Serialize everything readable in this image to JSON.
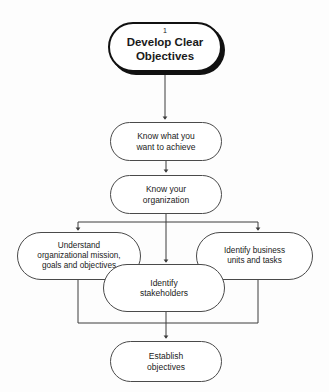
{
  "diagram": {
    "background_color": "#fdfdfd",
    "line_color": "#3d3d3d",
    "node_border_color": "#4a4a4a",
    "node_fill_color": "#ffffff",
    "text_color": "#1a1a1a",
    "nodes": {
      "start": {
        "step_number": "1",
        "label": "Develop Clear\nObjectives",
        "shape": "rounded-terminator",
        "emphasis": "bold-with-shadow"
      },
      "step2": {
        "label": "Know what you\nwant to achieve",
        "shape": "rounded-rectangle"
      },
      "step3": {
        "label": "Know your\norganization",
        "shape": "rounded-rectangle"
      },
      "branch_left": {
        "label": "Understand\norganizational mission,\ngoals and objectives",
        "shape": "rounded-rectangle"
      },
      "branch_center": {
        "label": "Identify\nstakeholders",
        "shape": "rounded-rectangle"
      },
      "branch_right": {
        "label": "Identify business\nunits and tasks",
        "shape": "rounded-rectangle"
      },
      "end": {
        "label": "Establish\nobjectives",
        "shape": "rounded-rectangle"
      }
    },
    "edges": [
      {
        "from": "start",
        "to": "step2",
        "type": "arrow-down"
      },
      {
        "from": "step2",
        "to": "step3",
        "type": "arrow-down"
      },
      {
        "from": "step3",
        "to": "branch_left",
        "type": "split-arrow-left"
      },
      {
        "from": "step3",
        "to": "branch_center",
        "type": "arrow-down"
      },
      {
        "from": "step3",
        "to": "branch_right",
        "type": "split-arrow-right"
      },
      {
        "from": "branch_left",
        "to": "end",
        "type": "merge-arrow"
      },
      {
        "from": "branch_center",
        "to": "end",
        "type": "arrow-down"
      },
      {
        "from": "branch_right",
        "to": "end",
        "type": "merge-arrow"
      }
    ]
  }
}
